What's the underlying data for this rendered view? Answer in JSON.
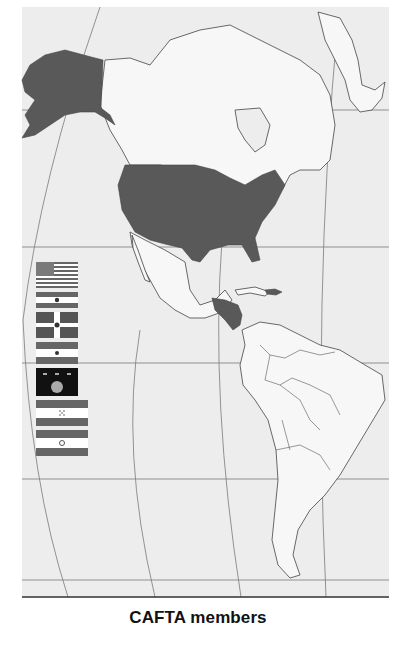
{
  "caption": "CAFTA members",
  "map": {
    "projection": "oblique graticule",
    "region": "Americas",
    "highlighted_countries": [
      "United States",
      "Guatemala",
      "El Salvador",
      "Honduras",
      "Nicaragua",
      "Costa Rica",
      "Dominican Republic"
    ],
    "colors": {
      "ocean": "#ededed",
      "land": "#f7f7f7",
      "member_fill": "#595959",
      "border": "#444444",
      "graticule": "#777777",
      "frame_bottom": "#333333"
    }
  },
  "legend": {
    "flags": [
      {
        "country": "United States"
      },
      {
        "country": "Nicaragua"
      },
      {
        "country": "Dominican Republic"
      },
      {
        "country": "El Salvador"
      },
      {
        "country": "Costa Rica"
      },
      {
        "country": "Honduras"
      },
      {
        "country": "Guatemala"
      }
    ]
  }
}
